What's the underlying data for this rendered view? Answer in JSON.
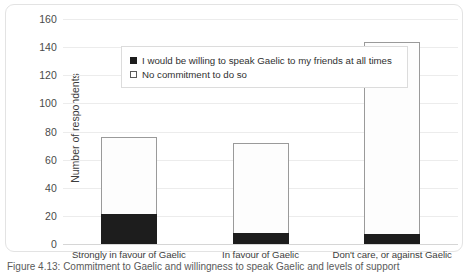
{
  "chart_data": {
    "type": "bar",
    "subtype": "stacked-column",
    "title": "",
    "xlabel": "",
    "ylabel": "Number of respondents",
    "ylim": [
      0,
      160
    ],
    "ytick_step": 20,
    "yticks": [
      "160",
      "140",
      "120",
      "100",
      "80",
      "60",
      "40",
      "20",
      "0"
    ],
    "grid": "horizontal",
    "legend_position": "top-left inside plot",
    "categories": [
      "Strongly in favour of Gaelic",
      "In favour of Gaelic",
      "Don't care, or against Gaelic"
    ],
    "series": [
      {
        "name": "I would be willing to speak Gaelic to my friends at all times",
        "marker": "filled-square",
        "color": "#1d1d1d",
        "values": [
          21,
          8,
          7
        ]
      },
      {
        "name": "No commitment to do so",
        "marker": "hollow-square",
        "color": "#ffffff",
        "values": [
          55,
          64,
          137
        ]
      }
    ],
    "totals": [
      76,
      72,
      144
    ]
  },
  "legend": {
    "items": [
      {
        "label": "I would be willing to speak Gaelic to my friends at all times"
      },
      {
        "label": "No commitment to do so"
      }
    ]
  },
  "caption": {
    "text": "Figure 4.13: Commitment to Gaelic and willingness to speak Gaelic and levels of support"
  },
  "colors": {
    "bar_fill_dark": "#1d1d1d",
    "bar_fill_light": "#fdfdfd",
    "bar_outline": "#9a9a9a",
    "grid": "#ececec",
    "frame": "#e3e3e3"
  }
}
